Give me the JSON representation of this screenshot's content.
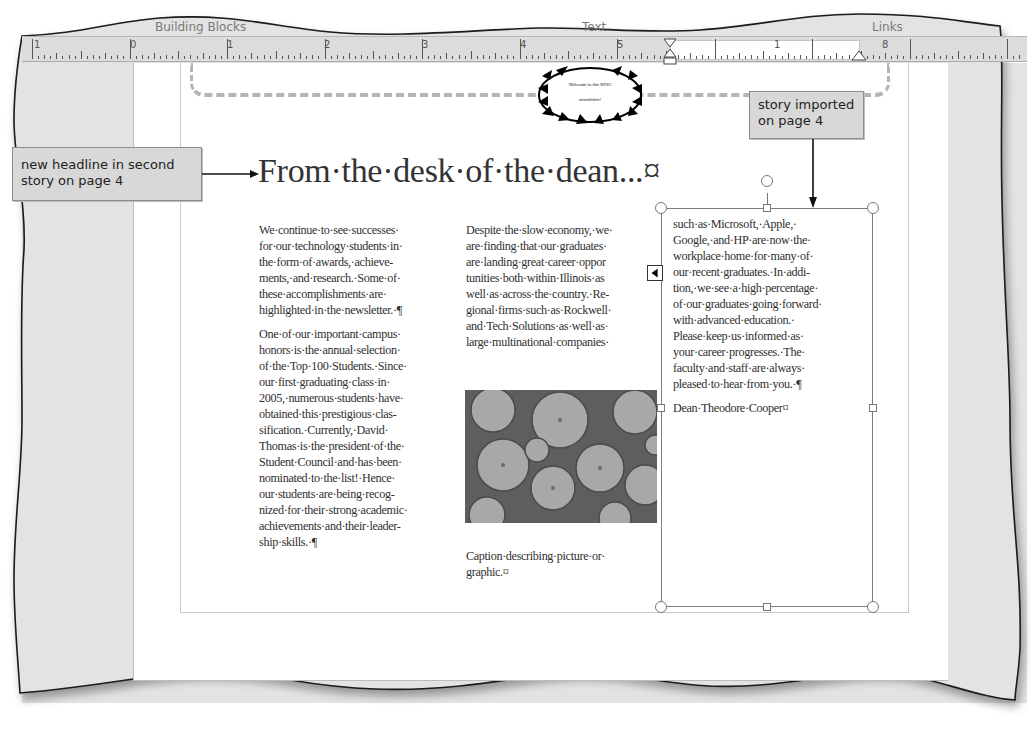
{
  "ribbon_groups": {
    "building_blocks": "Building Blocks",
    "text": "Text",
    "links": "Links"
  },
  "ruler": {
    "labels": [
      "1",
      "0",
      "1",
      "2",
      "3",
      "4",
      "5",
      "1",
      "8"
    ]
  },
  "header_graphic": {
    "line1": "Welcome to the WMU",
    "line2": "newsletter!"
  },
  "headline": "From·the·desk·of·the·dean...¤",
  "story": {
    "column1": {
      "paragraph1": [
        "We·continue·to·see·successes·",
        "for·our·technology·students·in·",
        "the·form·of·awards,·achieve-",
        "ments,·and·research.·Some·of·",
        "these·accomplishments·are·",
        "highlighted·in·the·newsletter.·¶"
      ],
      "paragraph2": [
        "One·of·our·important·campus·",
        "honors·is·the·annual·selection·",
        "of·the·Top·100·Students.·Since·",
        "our·first·graduating·class·in·",
        "2005,·numerous·students·have·",
        "obtained·this·prestigious·clas-",
        "sification.·Currently,·David·",
        "Thomas·is·the·president·of·the·",
        "Student·Council·and·has·been·",
        "nominated·to·the·list!·Hence·",
        "our·students·are·being·recog-",
        "nized·for·their·strong·academic·",
        "achievements·and·their·leader-",
        "ship·skills.·¶"
      ]
    },
    "column2": {
      "paragraph1": [
        "Despite·the·slow·economy,·we·",
        "are·finding·that·our·graduates·",
        "are·landing·great·career·oppor",
        "tunities·both·within·Illinois·as",
        "well·as·across·the·country.·Re-",
        "gional·firms·such·as·Rockwell·",
        "and·Tech·Solutions·as·well·as·",
        "large·multinational·companies·"
      ],
      "caption": [
        "Caption·describing·picture·or·",
        "graphic.¤"
      ]
    },
    "column3": {
      "paragraph1": [
        "such·as·Microsoft,·Apple,·",
        "Google,·and·HP·are·now·the·",
        "workplace·home·for·many·of·",
        "our·recent·graduates.·In·addi-",
        "tion,·we·see·a·high·percentage·",
        "of·our·graduates·going·forward·",
        "with·advanced·education.·",
        "Please·keep·us·informed·as·",
        "your·career·progresses.·The·",
        "faculty·and·staff·are·always·",
        "pleased·to·hear·from·you.·¶"
      ],
      "signature": "Dean·Theodore·Cooper¤"
    }
  },
  "callouts": {
    "left": [
      "new headline in second",
      "story on page 4"
    ],
    "right": [
      "story imported",
      "on page 4"
    ]
  },
  "colors": {
    "workspace": "#e3e3e3",
    "ruler": "#dcdcdc",
    "callout_bg": "#d8d8d8",
    "text": "#2f2f2f"
  }
}
